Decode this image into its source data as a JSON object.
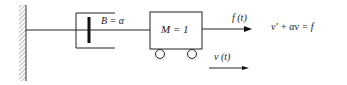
{
  "diagram": {
    "damper_label": "B = α",
    "mass_label": "M = 1",
    "force_label": "f (t)",
    "velocity_label": "v (t)",
    "equation": "v′ +  αv = f"
  }
}
